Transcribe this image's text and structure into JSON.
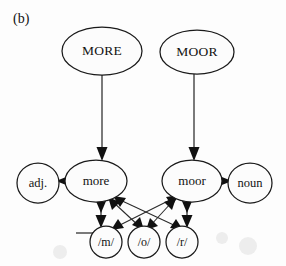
{
  "figure": {
    "panel_tag": "(b)",
    "ink_color": "#1a1a1a",
    "background_color": "#fdfdfd"
  },
  "nodes": {
    "word_level": [
      {
        "id": "MORE",
        "label": "MORE",
        "shape": "ellipse",
        "cx": 102,
        "cy": 51,
        "rx": 40,
        "ry": 24
      },
      {
        "id": "MOOR",
        "label": "MOOR",
        "shape": "ellipse",
        "cx": 197,
        "cy": 52,
        "rx": 37,
        "ry": 22
      }
    ],
    "lexical_level": [
      {
        "id": "more",
        "label": "more",
        "shape": "ellipse",
        "cx": 96,
        "cy": 181,
        "rx": 31,
        "ry": 21
      },
      {
        "id": "moor",
        "label": "moor",
        "shape": "ellipse",
        "cx": 192,
        "cy": 181,
        "rx": 30,
        "ry": 21
      }
    ],
    "category_level": [
      {
        "id": "adj",
        "label": "adj.",
        "shape": "circle",
        "cx": 38,
        "cy": 183,
        "rx": 21,
        "ry": 20
      },
      {
        "id": "noun",
        "label": "noun",
        "shape": "circle",
        "cx": 250,
        "cy": 183,
        "rx": 22,
        "ry": 20
      }
    ],
    "phoneme_level": [
      {
        "id": "m",
        "label": "/m/",
        "shape": "circle",
        "cx": 106,
        "cy": 242,
        "rx": 16,
        "ry": 16
      },
      {
        "id": "o",
        "label": "/o/",
        "shape": "circle",
        "cx": 144,
        "cy": 242,
        "rx": 16,
        "ry": 16
      },
      {
        "id": "r",
        "label": "/r/",
        "shape": "circle",
        "cx": 182,
        "cy": 242,
        "rx": 16,
        "ry": 16
      }
    ]
  },
  "edges": [
    {
      "id": "more-to-lex",
      "from": "MORE",
      "to": "more",
      "direction": "down",
      "style": "straight"
    },
    {
      "id": "moor-to-lex",
      "from": "MOOR",
      "to": "moor",
      "direction": "down",
      "style": "straight"
    },
    {
      "id": "more-to-adj",
      "from": "more",
      "to": "adj",
      "direction": "left",
      "style": "straight"
    },
    {
      "id": "moor-to-noun",
      "from": "moor",
      "to": "noun",
      "direction": "right",
      "style": "straight"
    },
    {
      "id": "more-m",
      "from": "more",
      "to": "m",
      "direction": "bidirectional",
      "style": "straight"
    },
    {
      "id": "more-o",
      "from": "more",
      "to": "o",
      "direction": "bidirectional",
      "style": "diagonal"
    },
    {
      "id": "more-r",
      "from": "more",
      "to": "r",
      "direction": "bidirectional",
      "style": "diagonal"
    },
    {
      "id": "moor-m",
      "from": "moor",
      "to": "m",
      "direction": "bidirectional",
      "style": "diagonal"
    },
    {
      "id": "moor-o",
      "from": "moor",
      "to": "o",
      "direction": "bidirectional",
      "style": "diagonal"
    },
    {
      "id": "moor-r",
      "from": "moor",
      "to": "r",
      "direction": "bidirectional",
      "style": "straight"
    }
  ],
  "marks": {
    "inhibitory_tick": {
      "id": "phoneme-tick",
      "x1": 76,
      "y1": 233,
      "x2": 93,
      "y2": 233
    }
  }
}
